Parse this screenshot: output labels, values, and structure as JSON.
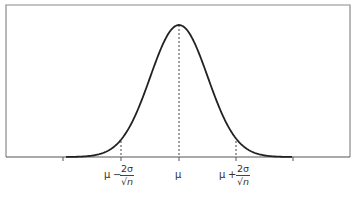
{
  "figure": {
    "colors": {
      "curve": "#222222",
      "axis": "#555555",
      "frame": "#777777",
      "dashed": "#444444",
      "text": "#333333"
    }
  },
  "labels": {
    "left": {
      "base": "μ",
      "op": "−",
      "numerator": "2σ",
      "sqrt": "√",
      "denominator": "n"
    },
    "center": {
      "text": "μ"
    },
    "right": {
      "base": "μ",
      "op": "+",
      "numerator": "2σ",
      "sqrt": "√",
      "denominator": "n"
    }
  }
}
